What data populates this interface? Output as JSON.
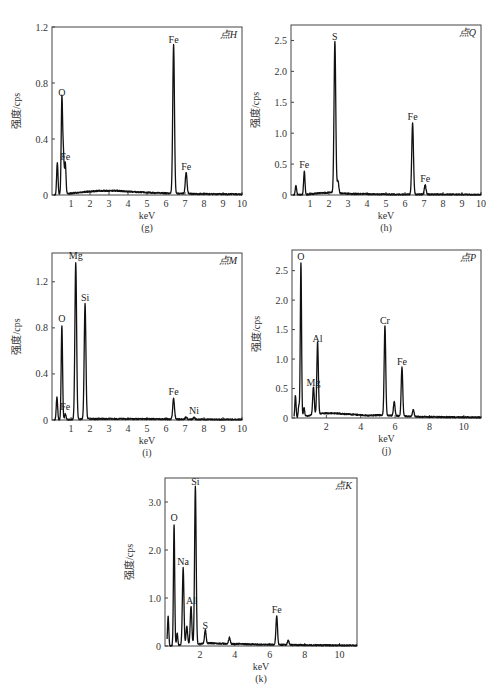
{
  "chart_data": [
    {
      "type": "line",
      "panel": "g",
      "caption": "(g)",
      "point_label": "点H",
      "xlabel": "keV",
      "ylabel": "强度/cps",
      "xlim": [
        0,
        10
      ],
      "ylim": [
        0,
        1.2
      ],
      "xticks": [
        "1",
        "2",
        "3",
        "4",
        "5",
        "6",
        "7",
        "8",
        "9",
        "10"
      ],
      "yticks": [
        "0",
        "0.4",
        "0.8",
        "1.2"
      ],
      "ytick_values": [
        0,
        0.4,
        0.8,
        1.2
      ],
      "peaks": [
        {
          "x": 0.28,
          "y": 0.23,
          "label": ""
        },
        {
          "x": 0.52,
          "y": 0.68,
          "label": "O"
        },
        {
          "x": 0.6,
          "y": 0.28,
          "label": ""
        },
        {
          "x": 0.7,
          "y": 0.22,
          "label": "Fe"
        },
        {
          "x": 6.4,
          "y": 1.06,
          "label": "Fe"
        },
        {
          "x": 7.06,
          "y": 0.15,
          "label": "Fe"
        }
      ],
      "background": [
        [
          0.9,
          0.01
        ],
        [
          1.5,
          0.02
        ],
        [
          2.5,
          0.03
        ],
        [
          3.5,
          0.03
        ],
        [
          4.5,
          0.02
        ],
        [
          5.5,
          0.015
        ],
        [
          7.5,
          0.008
        ],
        [
          10,
          0.005
        ]
      ]
    },
    {
      "type": "line",
      "panel": "h",
      "caption": "(h)",
      "point_label": "点Q",
      "xlabel": "keV",
      "ylabel": "强度/cps",
      "xlim": [
        0,
        10
      ],
      "ylim": [
        0,
        2.75
      ],
      "xticks": [
        "1",
        "2",
        "3",
        "4",
        "5",
        "6",
        "7",
        "8",
        "9",
        "10"
      ],
      "yticks": [
        "0",
        "0.5",
        "1.0",
        "1.5",
        "2.0",
        "2.5"
      ],
      "ytick_values": [
        0,
        0.5,
        1.0,
        1.5,
        2.0,
        2.5
      ],
      "peaks": [
        {
          "x": 0.26,
          "y": 0.15,
          "label": ""
        },
        {
          "x": 0.7,
          "y": 0.37,
          "label": "Fe"
        },
        {
          "x": 2.31,
          "y": 2.45,
          "label": "S"
        },
        {
          "x": 2.47,
          "y": 0.2,
          "label": ""
        },
        {
          "x": 6.4,
          "y": 1.15,
          "label": "Fe"
        },
        {
          "x": 7.06,
          "y": 0.15,
          "label": "Fe"
        }
      ],
      "background": [
        [
          0.9,
          0.01
        ],
        [
          1.5,
          0.03
        ],
        [
          2.0,
          0.04
        ],
        [
          3,
          0.02
        ],
        [
          5,
          0.01
        ],
        [
          7.5,
          0.01
        ],
        [
          10,
          0.005
        ]
      ]
    },
    {
      "type": "line",
      "panel": "i",
      "caption": "(i)",
      "point_label": "点M",
      "xlabel": "keV",
      "ylabel": "强度/cps",
      "xlim": [
        0,
        10
      ],
      "ylim": [
        0,
        1.45
      ],
      "xticks": [
        "1",
        "2",
        "3",
        "4",
        "5",
        "6",
        "7",
        "8",
        "9",
        "10"
      ],
      "yticks": [
        "0",
        "0.4",
        "0.8",
        "1.2"
      ],
      "ytick_values": [
        0,
        0.4,
        0.8,
        1.2
      ],
      "peaks": [
        {
          "x": 0.26,
          "y": 0.2,
          "label": ""
        },
        {
          "x": 0.52,
          "y": 0.82,
          "label": "O"
        },
        {
          "x": 0.7,
          "y": 0.05,
          "label": "Fe"
        },
        {
          "x": 1.25,
          "y": 1.36,
          "label": "Mg"
        },
        {
          "x": 1.74,
          "y": 1.0,
          "label": "Si"
        },
        {
          "x": 6.4,
          "y": 0.18,
          "label": "Fe"
        },
        {
          "x": 7.06,
          "y": 0.02,
          "label": ""
        },
        {
          "x": 7.48,
          "y": 0.015,
          "label": "Ni"
        }
      ],
      "background": [
        [
          2.0,
          0.01
        ],
        [
          4,
          0.01
        ],
        [
          6,
          0.008
        ],
        [
          8,
          0.005
        ],
        [
          10,
          0.004
        ]
      ]
    },
    {
      "type": "line",
      "panel": "j",
      "caption": "(j)",
      "point_label": "点P",
      "xlabel": "keV",
      "ylabel": "强度/cps",
      "xlim": [
        0,
        11
      ],
      "ylim": [
        0,
        2.85
      ],
      "xticks": [
        "2",
        "4",
        "6",
        "8",
        "10"
      ],
      "xtick_values": [
        2,
        4,
        6,
        8,
        10
      ],
      "yticks": [
        "0",
        "0.5",
        "1.0",
        "1.5",
        "2.0",
        "2.5"
      ],
      "ytick_values": [
        0,
        0.5,
        1.0,
        1.5,
        2.0,
        2.5
      ],
      "peaks": [
        {
          "x": 0.2,
          "y": 0.38,
          "label": ""
        },
        {
          "x": 0.4,
          "y": 0.2,
          "label": ""
        },
        {
          "x": 0.52,
          "y": 2.62,
          "label": "O"
        },
        {
          "x": 0.7,
          "y": 0.15,
          "label": ""
        },
        {
          "x": 1.25,
          "y": 0.48,
          "label": "Mg"
        },
        {
          "x": 1.49,
          "y": 1.22,
          "label": "Al"
        },
        {
          "x": 5.41,
          "y": 1.52,
          "label": "Cr"
        },
        {
          "x": 5.95,
          "y": 0.24,
          "label": ""
        },
        {
          "x": 6.4,
          "y": 0.83,
          "label": "Fe"
        },
        {
          "x": 7.06,
          "y": 0.12,
          "label": ""
        }
      ],
      "background": [
        [
          1.8,
          0.08
        ],
        [
          2.5,
          0.08
        ],
        [
          3.5,
          0.06
        ],
        [
          4.5,
          0.04
        ],
        [
          5.0,
          0.05
        ],
        [
          7.5,
          0.02
        ],
        [
          9,
          0.015
        ],
        [
          11,
          0.01
        ]
      ]
    },
    {
      "type": "line",
      "panel": "k",
      "caption": "(k)",
      "point_label": "点K",
      "xlabel": "keV",
      "ylabel": "强度/cps",
      "xlim": [
        0,
        11
      ],
      "ylim": [
        0,
        3.5
      ],
      "xticks": [
        "2",
        "4",
        "6",
        "8",
        "10"
      ],
      "xtick_values": [
        2,
        4,
        6,
        8,
        10
      ],
      "yticks": [
        "0",
        "1.0",
        "2.0",
        "3.0"
      ],
      "ytick_values": [
        0,
        1.0,
        2.0,
        3.0
      ],
      "peaks": [
        {
          "x": 0.18,
          "y": 0.62,
          "label": ""
        },
        {
          "x": 0.52,
          "y": 2.52,
          "label": "O"
        },
        {
          "x": 0.7,
          "y": 0.25,
          "label": ""
        },
        {
          "x": 1.04,
          "y": 1.6,
          "label": "Na"
        },
        {
          "x": 1.25,
          "y": 0.38,
          "label": ""
        },
        {
          "x": 1.49,
          "y": 0.8,
          "label": "Al"
        },
        {
          "x": 1.74,
          "y": 3.28,
          "label": "Si"
        },
        {
          "x": 2.31,
          "y": 0.28,
          "label": "S"
        },
        {
          "x": 3.69,
          "y": 0.13,
          "label": ""
        },
        {
          "x": 6.4,
          "y": 0.6,
          "label": "Fe"
        },
        {
          "x": 7.06,
          "y": 0.1,
          "label": ""
        }
      ],
      "background": [
        [
          2.6,
          0.06
        ],
        [
          3.2,
          0.05
        ],
        [
          4.5,
          0.04
        ],
        [
          5.5,
          0.03
        ],
        [
          8,
          0.02
        ],
        [
          11,
          0.01
        ]
      ]
    }
  ]
}
